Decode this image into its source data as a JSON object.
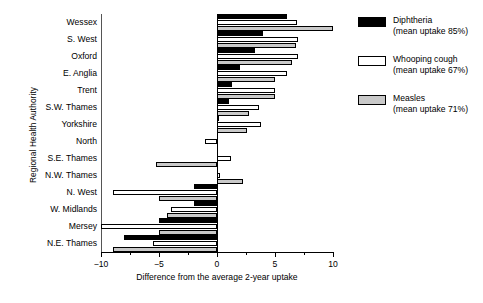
{
  "chart_data": {
    "type": "bar",
    "orientation": "horizontal",
    "title": "",
    "xlabel": "Difference from the average 2-year uptake",
    "ylabel": "Regional Health Authority",
    "xlim": [
      -10,
      10
    ],
    "xticks": [
      -10,
      -5,
      0,
      5,
      10
    ],
    "xticklabels": [
      "-10",
      "-5",
      "0",
      "5",
      "10"
    ],
    "grid": false,
    "legend_position": "right",
    "categories": [
      "Wessex",
      "S. West",
      "Oxford",
      "E. Anglia",
      "Trent",
      "S.W. Thames",
      "Yorkshire",
      "North",
      "S.E. Thames",
      "N.W. Thames",
      "N. West",
      "W. Midlands",
      "Mersey",
      "N.E. Thames"
    ],
    "series": [
      {
        "name": "Diphtheria",
        "sublabel": "(mean uptake 85%)",
        "color": "#000000",
        "values": [
          6.0,
          4.0,
          3.3,
          2.0,
          1.3,
          1.0,
          0.2,
          0.0,
          0.0,
          0.0,
          -2.0,
          -2.0,
          -5.0,
          -8.0
        ]
      },
      {
        "name": "Whooping cough",
        "sublabel": "(mean uptake 67%)",
        "color": "#ffffff",
        "values": [
          6.9,
          7.0,
          7.0,
          6.0,
          5.0,
          3.6,
          3.8,
          -1.0,
          1.2,
          0.3,
          -9.0,
          -4.0,
          -10.0,
          -5.5
        ]
      },
      {
        "name": "Measles",
        "sublabel": "(mean uptake 71%)",
        "color": "#c9c9c9",
        "values": [
          10.0,
          6.8,
          6.5,
          5.0,
          5.0,
          2.8,
          2.6,
          0.0,
          -5.3,
          2.2,
          -5.0,
          -4.3,
          -5.0,
          -9.0
        ]
      }
    ]
  },
  "axis": {
    "xlabel": "Difference from the average 2-year uptake",
    "ylabel": "Regional Health Authority"
  },
  "legend": {
    "entries": [
      {
        "label": "Diphtheria",
        "sub": "(mean uptake 85%)"
      },
      {
        "label": "Whooping cough",
        "sub": "(mean uptake 67%)"
      },
      {
        "label": "Measles",
        "sub": "(mean uptake 71%)"
      }
    ]
  }
}
